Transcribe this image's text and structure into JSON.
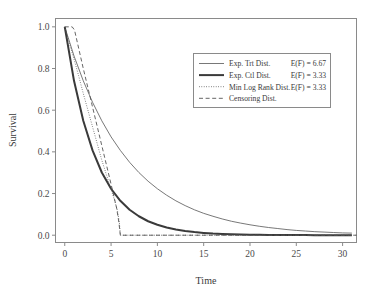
{
  "chart_data": {
    "type": "line",
    "title": "",
    "xlabel": "Time",
    "ylabel": "Survival",
    "xlim": [
      -1.0,
      31.5
    ],
    "ylim": [
      -0.035,
      1.04
    ],
    "xticks": [
      0,
      5,
      10,
      15,
      20,
      25,
      30
    ],
    "xtick_labels": [
      "0",
      "5",
      "10",
      "15",
      "20",
      "25",
      "30"
    ],
    "yticks": [
      0.0,
      0.2,
      0.4,
      0.6,
      0.8,
      1.0
    ],
    "ytick_labels": [
      "0.0",
      "0.2",
      "0.4",
      "0.6",
      "0.8",
      "1.0"
    ],
    "grid": false,
    "legend_position": "upper right",
    "series": [
      {
        "name": "Exp. Trt Dist.",
        "stat_label": "E(F) = 6.67",
        "style": "solid-thin",
        "color": "#555555",
        "mean": 6.67,
        "x": [
          0,
          1,
          2,
          3,
          4,
          5,
          6,
          7,
          8,
          9,
          10,
          11,
          12,
          13,
          14,
          15,
          16,
          17,
          18,
          19,
          20,
          21,
          22,
          23,
          24,
          25,
          26,
          27,
          28,
          29,
          30,
          31
        ],
        "y": [
          1.0,
          0.86,
          0.741,
          0.638,
          0.549,
          0.472,
          0.407,
          0.35,
          0.301,
          0.259,
          0.223,
          0.192,
          0.165,
          0.142,
          0.122,
          0.105,
          0.091,
          0.078,
          0.067,
          0.058,
          0.05,
          0.043,
          0.037,
          0.032,
          0.027,
          0.023,
          0.02,
          0.017,
          0.015,
          0.013,
          0.011,
          0.01
        ]
      },
      {
        "name": "Exp. Ctl Dist.",
        "stat_label": "E(F) = 3.33",
        "style": "solid-thick",
        "color": "#3a3a3a",
        "mean": 3.33,
        "x": [
          0,
          1,
          2,
          3,
          4,
          5,
          6,
          7,
          8,
          9,
          10,
          11,
          12,
          13,
          14,
          15,
          16,
          17,
          18,
          19,
          20,
          21,
          22,
          23,
          24,
          25,
          26,
          27,
          28,
          29,
          30,
          31
        ],
        "y": [
          1.0,
          0.741,
          0.549,
          0.407,
          0.301,
          0.223,
          0.165,
          0.122,
          0.091,
          0.067,
          0.05,
          0.037,
          0.027,
          0.02,
          0.015,
          0.011,
          0.008,
          0.006,
          0.004,
          0.003,
          0.002,
          0.0017,
          0.0013,
          0.0009,
          0.0007,
          0.0005,
          0.0004,
          0.0003,
          0.0002,
          0.00015,
          0.0001,
          8e-05
        ]
      },
      {
        "name": "Min Log Rank Dist.",
        "stat_label": "E(F) = 3.33",
        "style": "dotted",
        "color": "#555555",
        "mean": 3.33,
        "x": [
          0,
          0.5,
          1,
          1.5,
          2,
          2.5,
          3,
          3.5,
          4,
          4.5,
          5,
          5.4,
          5.7,
          5.9,
          5.95,
          6.0,
          6.0,
          31.5
        ],
        "y": [
          1.0,
          0.92,
          0.845,
          0.765,
          0.68,
          0.6,
          0.52,
          0.44,
          0.36,
          0.29,
          0.22,
          0.165,
          0.115,
          0.06,
          0.03,
          0.005,
          0.0,
          0.0
        ]
      },
      {
        "name": "Censoring Dist.",
        "stat_label": "",
        "style": "dashed",
        "color": "#555555",
        "x": [
          0,
          0.8,
          1.05,
          2,
          3,
          4,
          5,
          5.6,
          5.85,
          6.0,
          31.5
        ],
        "y": [
          1.0,
          1.0,
          0.985,
          0.8,
          0.615,
          0.43,
          0.245,
          0.13,
          0.06,
          0.0,
          0.0
        ]
      }
    ]
  },
  "legend": {
    "entries": [
      {
        "label": "Exp. Trt Dist.",
        "value": "E(F) = 6.67"
      },
      {
        "label": "Exp. Ctl Dist.",
        "value": "E(F) = 3.33"
      },
      {
        "label": "Min Log Rank Dist.",
        "value": "E(F) = 3.33"
      },
      {
        "label": "Censoring Dist.",
        "value": ""
      }
    ]
  },
  "axes": {
    "x_title": "Time",
    "y_title": "Survival"
  },
  "colors": {
    "frame": "#8a8a8a",
    "text": "#3a3a3a",
    "curve_light": "#555555",
    "curve_dark": "#3a3a3a",
    "background": "#ffffff"
  }
}
